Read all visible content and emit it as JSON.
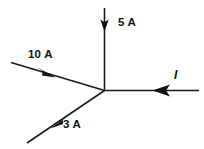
{
  "figure": {
    "background_color": "#ffffff",
    "line_color": "#1a1a1a",
    "text_color": "#111111",
    "junction": {
      "x": 104,
      "y": 90
    },
    "labels": {
      "top_branch": "5 A",
      "upper_left_branch": "10 A",
      "lower_left_branch": "3 A",
      "right_branch": "I"
    },
    "branches": [
      {
        "name": "top-branch",
        "label": "5 A",
        "direction": "into-junction",
        "orientation": "vertical-down",
        "start": {
          "x": 104,
          "y": 8
        },
        "end": {
          "x": 104,
          "y": 90
        },
        "arrow_at": {
          "x": 104,
          "y": 27
        }
      },
      {
        "name": "upper-left-branch",
        "label": "10 A",
        "direction": "into-junction",
        "orientation": "diagonal-down-right",
        "start": {
          "x": 11,
          "y": 63
        },
        "end": {
          "x": 104,
          "y": 90
        },
        "arrow_at": {
          "x": 47,
          "y": 73
        }
      },
      {
        "name": "lower-left-branch",
        "label": "3 A",
        "direction": "out-of-junction",
        "orientation": "diagonal-down-left",
        "start": {
          "x": 104,
          "y": 90
        },
        "end": {
          "x": 27,
          "y": 143
        },
        "arrow_at": {
          "x": 57,
          "y": 122
        }
      },
      {
        "name": "right-branch",
        "label": "I",
        "direction": "into-junction",
        "orientation": "horizontal-left",
        "start": {
          "x": 199,
          "y": 90
        },
        "end": {
          "x": 104,
          "y": 90
        },
        "arrow_at": {
          "x": 160,
          "y": 90
        }
      }
    ]
  }
}
